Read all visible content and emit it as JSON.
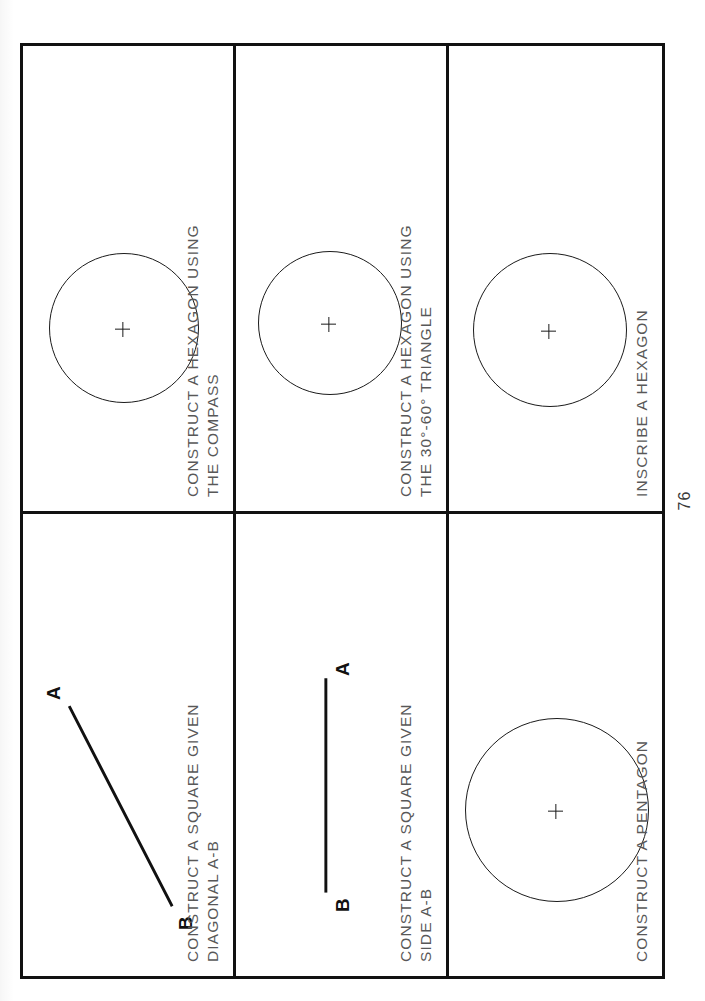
{
  "document": {
    "type": "technical-drawing-worksheet",
    "orientation": "rotated-90-ccw",
    "page_number": "76"
  },
  "panels": [
    {
      "id": "construct-square-given-diagonal",
      "caption": "CONSTRUCT A SQUARE GIVEN\nDIAGONAL A-B",
      "figure": "diagonal-line-segment",
      "point_labels": {
        "a": "A",
        "b": "B"
      }
    },
    {
      "id": "construct-square-given-side",
      "caption": "CONSTRUCT A SQUARE GIVEN\nSIDE A-B",
      "figure": "horizontal-line-segment",
      "point_labels": {
        "a": "A",
        "b": "B"
      }
    },
    {
      "id": "construct-pentagon",
      "caption": "CONSTRUCT A PENTAGON",
      "figure": "circle-with-center-mark"
    },
    {
      "id": "construct-hexagon-compass",
      "caption": "CONSTRUCT A HEXAGON USING\nTHE COMPASS",
      "figure": "circle-with-center-mark"
    },
    {
      "id": "construct-hexagon-triangle",
      "caption": "CONSTRUCT A HEXAGON USING\nTHE 30°-60° TRIANGLE",
      "figure": "circle-with-center-mark"
    },
    {
      "id": "inscribe-hexagon",
      "caption": "INSCRIBE A HEXAGON",
      "figure": "circle-with-center-mark"
    }
  ],
  "colors": {
    "ink": "#111111",
    "caption_gray": "#585858",
    "paper": "#ffffff"
  }
}
